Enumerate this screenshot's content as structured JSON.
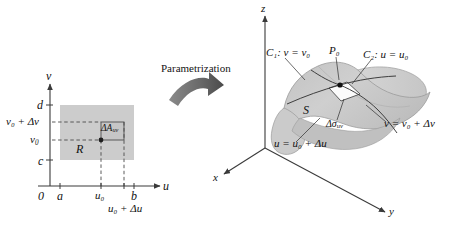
{
  "figure": {
    "transform_label": "Parametrization",
    "colors": {
      "region_fill": "#cccccc",
      "subrect_fill": "#c4c4c4",
      "surface_fill": "#c9c9c9",
      "surface_fill_light": "#d8d8d8",
      "patch_fill": "#ffffff",
      "axis": "#3a3a3a",
      "dashed": "#4a4a4a",
      "arrow_dark": "#555555",
      "text": "#111111"
    }
  },
  "left_panel": {
    "name": "uv-plane",
    "axes": {
      "horizontal_label": "u",
      "vertical_label": "v",
      "origin_label": "0"
    },
    "u_ticks": [
      "a",
      "b"
    ],
    "v_ticks": [
      "c",
      "d"
    ],
    "region_label": "R",
    "subrect_label_base": "ΔA",
    "subrect_label_sub": "uv",
    "marks": {
      "v0": "v",
      "v0_sub": "0",
      "v0_plus_dv": "v₀ + Δv",
      "u0": "u₀",
      "u0_plus_du": "u₀ + Δu"
    }
  },
  "right_panel": {
    "name": "xyz-space",
    "axes": {
      "x_label": "x",
      "y_label": "y",
      "z_label": "z"
    },
    "surface_label": "S",
    "point_label": "P₀",
    "curve1_label": "C₁: v = v₀",
    "curve2_label": "C₂: u = u₀",
    "patch_label_base": "Δσ",
    "patch_label_sub": "uv",
    "edge_label_v": "v = v₀ + Δv",
    "edge_label_u": "u = u₀ + Δu"
  }
}
